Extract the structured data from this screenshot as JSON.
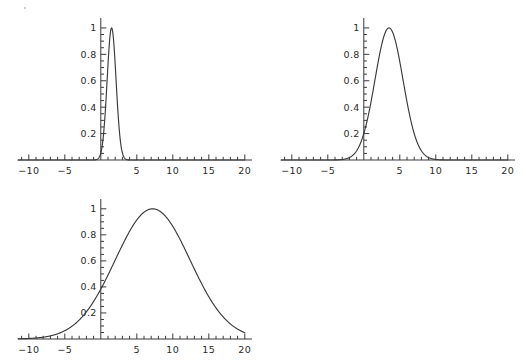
{
  "figure": {
    "background": "#ffffff",
    "line_color": "#3a3a3a",
    "text_color": "#2b2b2b",
    "panel_count": 3,
    "layout": "2x2-grid-with-empty-bottom-right"
  },
  "chart_data": [
    {
      "type": "line",
      "title": "",
      "xlabel": "",
      "ylabel": "",
      "xlim": [
        -11.5,
        21.0
      ],
      "ylim": [
        0,
        1.06
      ],
      "xticks": [
        -10,
        -5,
        5,
        10,
        15,
        20
      ],
      "xticklabels": [
        "-10",
        "-5",
        "5",
        "10",
        "15",
        "20"
      ],
      "yticks": [
        0.2,
        0.4,
        0.6,
        0.8,
        1
      ],
      "yticklabels": [
        "0.2",
        "0.4",
        "0.6",
        "0.8",
        "1"
      ],
      "minor_tick_step_x": 1,
      "minor_tick_step_y": 0.05,
      "grid": false,
      "legend": false,
      "axes_style": "cross-at-origin",
      "curve": {
        "name": "gaussian-narrow",
        "peak_x": 1.5,
        "peak_y": 1,
        "sigma": 0.62,
        "value_at_x0": 0.13
      },
      "x": [
        -11.5,
        -6,
        -4,
        -3,
        -2.5,
        -2,
        -1.5,
        -1,
        -0.5,
        0,
        0.25,
        0.5,
        0.75,
        1,
        1.25,
        1.5,
        1.75,
        2,
        2.25,
        2.5,
        2.75,
        3,
        3.5,
        4,
        4.5,
        5,
        6,
        8,
        12,
        16,
        21
      ],
      "values": [
        0,
        0,
        0,
        0.0002,
        0.0013,
        0.0068,
        0.0288,
        0.0975,
        0.2645,
        0.1353,
        0.2163,
        0.3247,
        0.4578,
        0.6065,
        0.7548,
        0.8825,
        0.9692,
        1.0,
        0.9692,
        0.8825,
        0.7548,
        0.6065,
        0.3247,
        0.1353,
        0.0439,
        0.0111,
        0.0003,
        0,
        0,
        0,
        0
      ]
    },
    {
      "type": "line",
      "title": "",
      "xlabel": "",
      "ylabel": "",
      "xlim": [
        -11.5,
        21.0
      ],
      "ylim": [
        0,
        1.06
      ],
      "xticks": [
        -10,
        -5,
        5,
        10,
        15,
        20
      ],
      "xticklabels": [
        "-10",
        "-5",
        "5",
        "10",
        "15",
        "20"
      ],
      "yticks": [
        0.2,
        0.4,
        0.6,
        0.8,
        1
      ],
      "yticklabels": [
        "0.2",
        "0.4",
        "0.6",
        "0.8",
        "1"
      ],
      "minor_tick_step_x": 1,
      "minor_tick_step_y": 0.05,
      "grid": false,
      "legend": false,
      "axes_style": "cross-at-origin",
      "curve": {
        "name": "gaussian-medium",
        "peak_x": 3.5,
        "peak_y": 1,
        "sigma": 1.95,
        "value_at_x0": 0.42
      },
      "x": [
        -11.5,
        -8,
        -7,
        -6,
        -5,
        -4,
        -3,
        -2,
        -1,
        0,
        1,
        2,
        3,
        3.5,
        4,
        5,
        6,
        7,
        8,
        9,
        10,
        11,
        12,
        14,
        17,
        21
      ],
      "values": [
        0,
        0.0003,
        0.0015,
        0.0063,
        0.0213,
        0.0625,
        0.1534,
        0.3166,
        0.5533,
        0.4244,
        0.5934,
        0.7879,
        0.9683,
        1.0,
        0.9683,
        0.7879,
        0.5934,
        0.3166,
        0.1534,
        0.0625,
        0.0213,
        0.0063,
        0.0015,
        0.0001,
        0,
        0
      ]
    },
    {
      "type": "line",
      "title": "",
      "xlabel": "",
      "ylabel": "",
      "xlim": [
        -11.5,
        21.0
      ],
      "ylim": [
        0,
        1.06
      ],
      "xticks": [
        -10,
        -5,
        5,
        10,
        15,
        20
      ],
      "xticklabels": [
        "-10",
        "-5",
        "5",
        "10",
        "15",
        "20"
      ],
      "yticks": [
        0.2,
        0.4,
        0.6,
        0.8,
        1
      ],
      "yticklabels": [
        "0.2",
        "0.4",
        "0.6",
        "0.8",
        "1"
      ],
      "minor_tick_step_x": 1,
      "minor_tick_step_y": 0.05,
      "grid": false,
      "legend": false,
      "axes_style": "cross-at-origin",
      "curve": {
        "name": "gaussian-wide",
        "peak_x": 7.2,
        "peak_y": 1,
        "sigma": 5.2,
        "value_at_x0": 0.38
      },
      "x": [
        -11.5,
        -10,
        -9,
        -8,
        -7,
        -6,
        -5,
        -4,
        -3,
        -2,
        -1,
        0,
        1,
        2,
        3,
        4,
        5,
        6,
        7.2,
        8,
        9,
        10,
        11,
        12,
        13,
        14,
        15,
        16,
        17,
        18,
        19,
        20,
        21
      ],
      "values": [
        0.0018,
        0.0041,
        0.0077,
        0.0137,
        0.0231,
        0.0372,
        0.0574,
        0.0848,
        0.12,
        0.1635,
        0.2144,
        0.38,
        0.3327,
        0.396,
        0.4594,
        0.5213,
        0.5798,
        0.6332,
        1.0,
        0.9849,
        0.9398,
        0.8719,
        0.7897,
        0.7006,
        0.6106,
        0.524,
        0.4434,
        0.3703,
        0.3053,
        0.2485,
        0.1995,
        0.028,
        0
      ]
    }
  ]
}
